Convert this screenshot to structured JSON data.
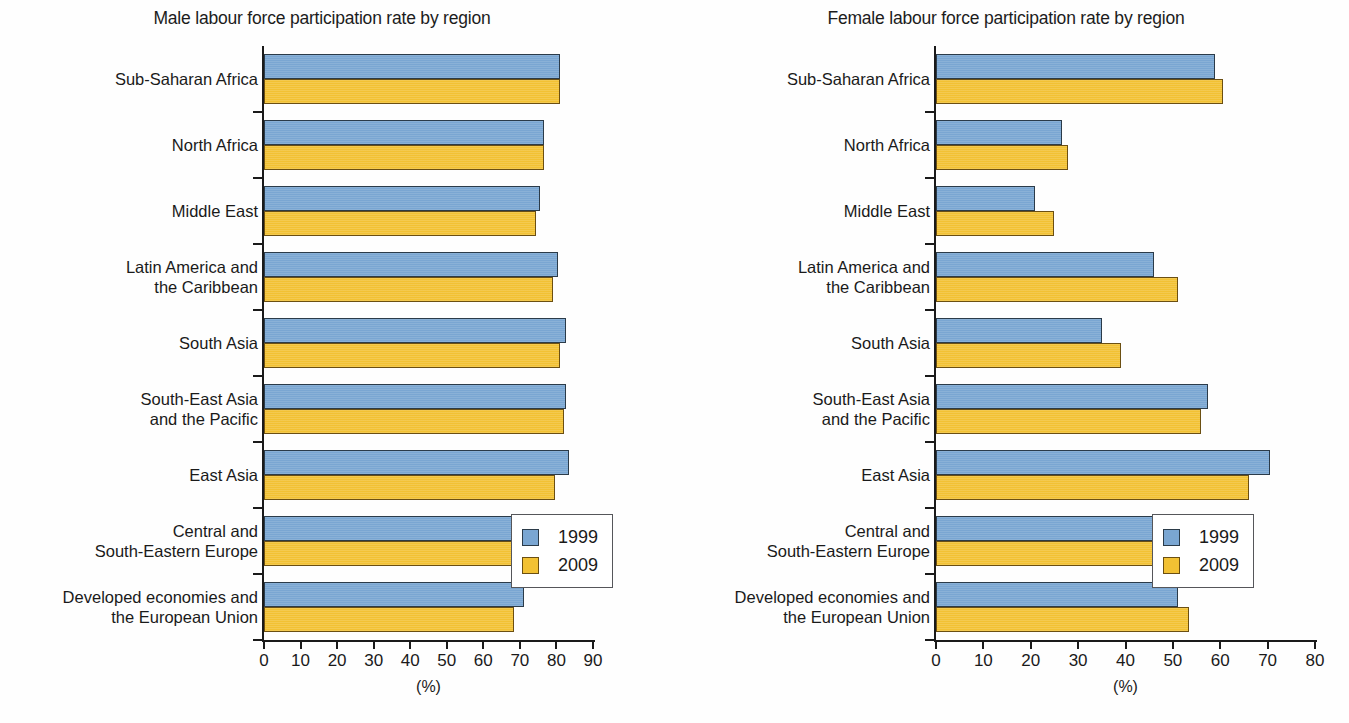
{
  "chart_data": [
    {
      "type": "bar",
      "orientation": "horizontal",
      "title": "Male labour force participation rate by region",
      "xlabel": "(%)",
      "ylabel": "",
      "xlim": [
        0,
        90
      ],
      "xticks": [
        0,
        10,
        20,
        30,
        40,
        50,
        60,
        70,
        80,
        90
      ],
      "grid": false,
      "legend_position": "bottom-right",
      "categories": [
        "Sub-Saharan Africa",
        "North Africa",
        "Middle East",
        "Latin America and\nthe Caribbean",
        "South Asia",
        "South-East Asia\nand the Pacific",
        "East Asia",
        "Central and\nSouth-Eastern Europe",
        "Developed economies and\nthe European Union"
      ],
      "series": [
        {
          "name": "1999",
          "color": "#7aa6d2",
          "values": [
            81.0,
            76.5,
            75.5,
            80.5,
            82.5,
            82.5,
            83.5,
            69.0,
            71.0
          ]
        },
        {
          "name": "2009",
          "color": "#f2c133",
          "values": [
            81.0,
            76.5,
            74.5,
            79.0,
            81.0,
            82.0,
            79.5,
            68.5,
            68.5
          ]
        }
      ]
    },
    {
      "type": "bar",
      "orientation": "horizontal",
      "title": "Female labour force participation rate by region",
      "xlabel": "(%)",
      "ylabel": "",
      "xlim": [
        0,
        80
      ],
      "xticks": [
        0,
        10,
        20,
        30,
        40,
        50,
        60,
        70,
        80
      ],
      "grid": false,
      "legend_position": "bottom-right",
      "categories": [
        "Sub-Saharan Africa",
        "North Africa",
        "Middle East",
        "Latin America and\nthe Caribbean",
        "South Asia",
        "South-East Asia\nand the Pacific",
        "East Asia",
        "Central and\nSouth-Eastern Europe",
        "Developed economies and\nthe European Union"
      ],
      "series": [
        {
          "name": "1999",
          "color": "#7aa6d2",
          "values": [
            58.8,
            26.5,
            21.0,
            46.0,
            35.0,
            57.5,
            70.5,
            49.0,
            51.0
          ]
        },
        {
          "name": "2009",
          "color": "#f2c133",
          "values": [
            60.5,
            27.8,
            25.0,
            51.0,
            39.0,
            56.0,
            66.0,
            50.5,
            53.5
          ]
        }
      ]
    }
  ],
  "legend": {
    "items": [
      {
        "label": "1999",
        "color": "#7aa6d2"
      },
      {
        "label": "2009",
        "color": "#f2c133"
      }
    ]
  }
}
